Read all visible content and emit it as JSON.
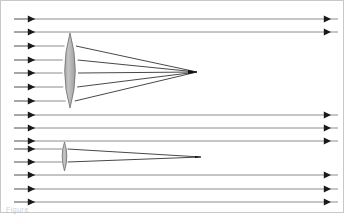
{
  "figure": {
    "width": 345,
    "height": 214,
    "background_color": "#ffffff",
    "border_color": "#c8c8c8",
    "caption_fragment": "Figure"
  },
  "style": {
    "ray_color": "#4d4d4d",
    "ray_color_light": "#8c8c8c",
    "refracted_ray_color": "#333333",
    "arrow_color": "#1a1a1a",
    "lens_fill": "#b5b5b5",
    "lens_fill_light": "#c9c9c9",
    "lens_stroke": "#6e6e6e",
    "ray_width": 1.0,
    "refracted_width": 0.9
  },
  "optics": {
    "incoming_ray_start_x": 14,
    "incoming_arrowhead_x": 35,
    "outgoing_arrowhead_x": 331,
    "right_edge_x": 338,
    "rays": [
      {
        "id": "ray-1",
        "y": 19,
        "intercepted_by": null,
        "passes_through": false
      },
      {
        "id": "ray-2",
        "y": 32,
        "intercepted_by": null,
        "passes_through": false
      },
      {
        "id": "ray-3",
        "y": 46,
        "intercepted_by": "large-lens",
        "passes_through": true
      },
      {
        "id": "ray-4",
        "y": 60,
        "intercepted_by": "large-lens",
        "passes_through": true
      },
      {
        "id": "ray-5",
        "y": 73,
        "intercepted_by": "large-lens",
        "passes_through": true
      },
      {
        "id": "ray-6",
        "y": 87,
        "intercepted_by": "large-lens",
        "passes_through": true
      },
      {
        "id": "ray-7",
        "y": 101,
        "intercepted_by": "large-lens",
        "passes_through": true
      },
      {
        "id": "ray-8",
        "y": 115,
        "intercepted_by": null,
        "passes_through": false
      },
      {
        "id": "ray-9",
        "y": 128,
        "intercepted_by": null,
        "passes_through": false
      },
      {
        "id": "ray-10",
        "y": 141,
        "intercepted_by": null,
        "passes_through": false
      },
      {
        "id": "ray-11",
        "y": 149,
        "intercepted_by": "small-lens",
        "passes_through": true
      },
      {
        "id": "ray-12",
        "y": 162,
        "intercepted_by": "small-lens",
        "passes_through": true
      },
      {
        "id": "ray-13",
        "y": 175,
        "intercepted_by": null,
        "passes_through": false
      },
      {
        "id": "ray-14",
        "y": 189,
        "intercepted_by": null,
        "passes_through": false
      },
      {
        "id": "ray-15",
        "y": 202,
        "intercepted_by": null,
        "passes_through": false
      }
    ],
    "lenses": [
      {
        "id": "large-lens",
        "label": "Large converging lens",
        "center_x": 70,
        "center_y": 71,
        "half_width": 8,
        "top_y": 33,
        "bottom_y": 108,
        "focal_point_x": 197,
        "focal_point_y": 72,
        "entry_rays": [
          46,
          60,
          73,
          87,
          101
        ]
      },
      {
        "id": "small-lens",
        "label": "Small converging lens",
        "center_x": 64.5,
        "center_y": 156,
        "half_width": 3.5,
        "top_y": 142,
        "bottom_y": 171,
        "focal_point_x": 201,
        "focal_point_y": 157,
        "entry_rays": [
          149,
          162
        ]
      }
    ]
  }
}
